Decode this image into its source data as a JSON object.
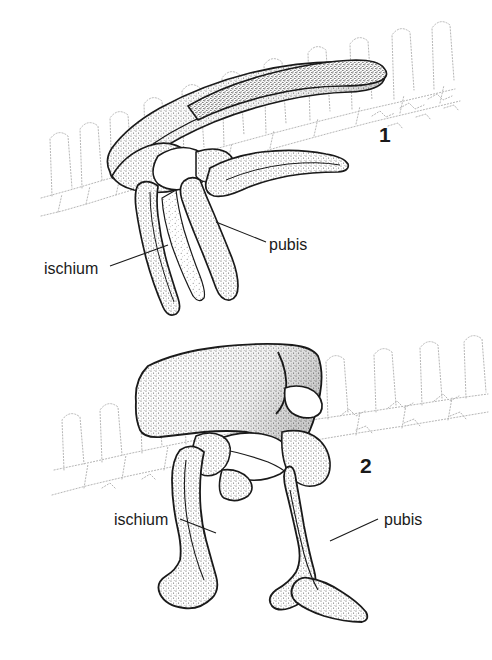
{
  "page": {
    "background_color": "#ffffff",
    "ink_color": "#1a1a1a",
    "stipple_color": "#4a4a4a",
    "ghost_color": "#b0b0b0",
    "width": 492,
    "height": 660
  },
  "figures": [
    {
      "number": "1",
      "caption_number": "1",
      "labels": [
        {
          "name": "ischium",
          "text": "ischium"
        },
        {
          "name": "pubis",
          "text": "pubis"
        }
      ]
    },
    {
      "number": "2",
      "caption_number": "2",
      "labels": [
        {
          "name": "ischium",
          "text": "ischium"
        },
        {
          "name": "pubis",
          "text": "pubis"
        }
      ]
    }
  ],
  "illustration": {
    "type": "line-and-stipple anatomical drawing",
    "subject": "dinosaur pelvic girdle in lateral view",
    "elements": [
      "ilium",
      "pubis",
      "ischium",
      "acetabulum",
      "sacral vertebrae",
      "neural spines"
    ]
  }
}
